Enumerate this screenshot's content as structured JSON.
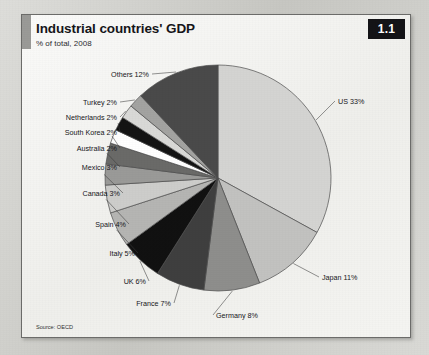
{
  "figure": {
    "number": "1.1",
    "title": "Industrial countries' GDP",
    "subtitle": "% of total, 2008",
    "source": "Source: OECD"
  },
  "chart_data": {
    "type": "pie",
    "title": "Industrial countries' GDP",
    "subtitle": "% of total, 2008",
    "unit": "% of total",
    "year": 2008,
    "start_angle_deg": 0,
    "direction": "clockwise",
    "legend": "none (direct labels with leader lines)",
    "grid": false,
    "categories": [
      "US",
      "Japan",
      "Germany",
      "France",
      "UK",
      "Italy",
      "Spain",
      "Canada",
      "Mexico",
      "Australia",
      "South Korea",
      "Netherlands",
      "Turkey",
      "Others"
    ],
    "values": [
      33,
      11,
      8,
      7,
      6,
      5,
      4,
      3,
      3,
      2,
      2,
      2,
      2,
      12
    ],
    "labels": [
      "US 33%",
      "Japan 11%",
      "Germany 8%",
      "France 7%",
      "UK 6%",
      "Italy 5%",
      "Spain 4%",
      "Canada 3%",
      "Mexico 3%",
      "Australia 2%",
      "South Korea 2%",
      "Netherlands 2%",
      "Turkey 2%",
      "Others 12%"
    ],
    "colors": [
      "#d4d4d2",
      "#c2c2c0",
      "#8e8e8c",
      "#3f3f3f",
      "#111111",
      "#b5b5b3",
      "#cdcdcb",
      "#9a9a98",
      "#6a6a68",
      "#ffffff",
      "#141414",
      "#d9d9d7",
      "#a3a3a1",
      "#4a4a4a"
    ],
    "slices": [
      {
        "name": "US",
        "value": 33,
        "label": "US 33%",
        "color": "#d4d4d2"
      },
      {
        "name": "Japan",
        "value": 11,
        "label": "Japan 11%",
        "color": "#c2c2c0"
      },
      {
        "name": "Germany",
        "value": 8,
        "label": "Germany 8%",
        "color": "#8e8e8c"
      },
      {
        "name": "France",
        "value": 7,
        "label": "France 7%",
        "color": "#3f3f3f"
      },
      {
        "name": "UK",
        "value": 6,
        "label": "UK 6%",
        "color": "#111111"
      },
      {
        "name": "Italy",
        "value": 5,
        "label": "Italy 5%",
        "color": "#b5b5b3"
      },
      {
        "name": "Spain",
        "value": 4,
        "label": "Spain 4%",
        "color": "#cdcdcb"
      },
      {
        "name": "Canada",
        "value": 3,
        "label": "Canada 3%",
        "color": "#9a9a98"
      },
      {
        "name": "Mexico",
        "value": 3,
        "label": "Mexico 3%",
        "color": "#6a6a68"
      },
      {
        "name": "Australia",
        "value": 2,
        "label": "Australia 2%",
        "color": "#ffffff"
      },
      {
        "name": "South Korea",
        "value": 2,
        "label": "South Korea 2%",
        "color": "#141414"
      },
      {
        "name": "Netherlands",
        "value": 2,
        "label": "Netherlands 2%",
        "color": "#d9d9d7"
      },
      {
        "name": "Turkey",
        "value": 2,
        "label": "Turkey 2%",
        "color": "#a3a3a1"
      },
      {
        "name": "Others",
        "value": 12,
        "label": "Others 12%",
        "color": "#4a4a4a"
      }
    ]
  }
}
